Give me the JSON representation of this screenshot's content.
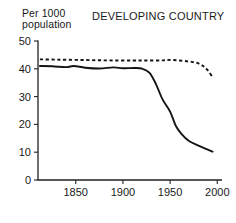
{
  "chart_data": {
    "type": "line",
    "title": "DEVELOPING COUNTRY",
    "ylabel": "Per 1000\npopulation",
    "xlabel": "",
    "xlim": [
      1810,
      2005
    ],
    "ylim": [
      0,
      50
    ],
    "xticks": [
      1850,
      1900,
      1950,
      2000
    ],
    "yticks": [
      0,
      10,
      20,
      30,
      40,
      50
    ],
    "xtick_labels": [
      "1850",
      "1900",
      "1950",
      "2000"
    ],
    "ytick_labels": [
      "0",
      "10",
      "20",
      "30",
      "40",
      "50"
    ],
    "grid": false,
    "legend": "none",
    "series": [
      {
        "name": "birth rate",
        "style": "dashed",
        "color": "#151515",
        "x": [
          1812,
          1830,
          1850,
          1870,
          1890,
          1910,
          1925,
          1940,
          1950,
          1960,
          1970,
          1978,
          1985,
          1990,
          1995
        ],
        "values": [
          43.4,
          43.3,
          43.2,
          43.1,
          43.0,
          43.0,
          43.0,
          43.0,
          43.2,
          43.0,
          42.6,
          42.2,
          41.0,
          39.4,
          37.0
        ]
      },
      {
        "name": "death rate",
        "style": "solid",
        "color": "#151515",
        "x": [
          1812,
          1825,
          1840,
          1848,
          1860,
          1875,
          1890,
          1900,
          1912,
          1920,
          1928,
          1935,
          1942,
          1950,
          1956,
          1962,
          1970,
          1980,
          1988,
          1995
        ],
        "values": [
          41.0,
          40.9,
          40.6,
          41.0,
          40.4,
          40.1,
          40.5,
          40.2,
          40.3,
          40.1,
          38.6,
          34.5,
          29.0,
          24.6,
          19.5,
          16.6,
          14.0,
          12.4,
          11.2,
          10.2
        ]
      }
    ]
  }
}
